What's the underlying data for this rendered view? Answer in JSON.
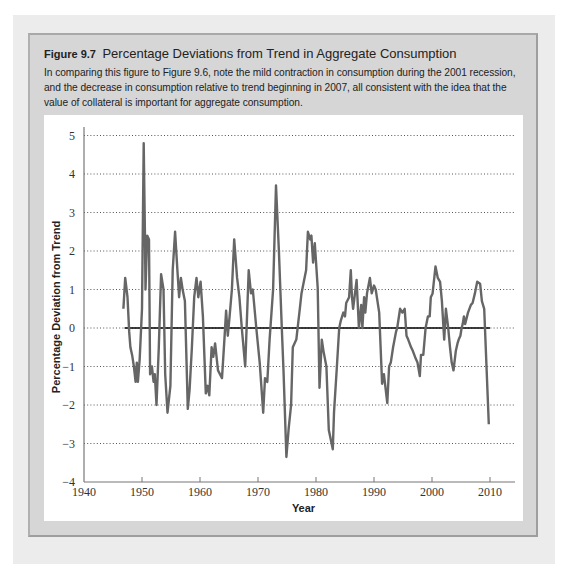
{
  "figure": {
    "number": "Figure 9.7",
    "title": "Percentage Deviations from Trend in Aggregate Consumption",
    "caption": "In comparing this figure to Figure 9.6, note the mild contraction in consumption during the 2001 recession, and the decrease in consumption relative to trend beginning in 2007, all consistent with the idea that the value of collateral is important for aggregate consumption."
  },
  "colors": {
    "series": "#666666",
    "zero_line": "#000000",
    "grid": "#555555",
    "figure_box": "#d6d6d6",
    "outer_bg": "#ececec"
  },
  "chart_data": {
    "type": "line",
    "title": "Percentage Deviations from Trend in Aggregate Consumption",
    "xlabel": "Year",
    "ylabel": "Percentage Deviation from Trend",
    "xlim": [
      1940,
      2012
    ],
    "ylim": [
      -4,
      5
    ],
    "xticks": [
      1940,
      1950,
      1960,
      1970,
      1980,
      1990,
      2000,
      2010
    ],
    "yticks": [
      5,
      4,
      3,
      2,
      1,
      0,
      -1,
      -2,
      -3,
      -4
    ],
    "grid": "horizontal dotted",
    "legend": "none",
    "reference_line": {
      "y": 0,
      "x_from": 1947,
      "x_to": 2010
    },
    "series": [
      {
        "name": "Consumption deviation from trend",
        "x": [
          1946.8,
          1947.1,
          1947.5,
          1947.8,
          1948.0,
          1948.3,
          1948.6,
          1948.9,
          1949.1,
          1949.3,
          1949.6,
          1950.0,
          1950.3,
          1950.5,
          1950.6,
          1950.9,
          1951.2,
          1951.4,
          1951.7,
          1952.0,
          1952.2,
          1952.5,
          1952.9,
          1953.3,
          1953.7,
          1954.0,
          1954.4,
          1954.9,
          1955.3,
          1955.7,
          1956.1,
          1956.4,
          1956.7,
          1957.0,
          1957.4,
          1957.9,
          1958.2,
          1958.6,
          1959.0,
          1959.4,
          1959.7,
          1960.1,
          1960.5,
          1961.0,
          1961.3,
          1961.6,
          1962.0,
          1962.3,
          1962.6,
          1963.1,
          1963.8,
          1964.2,
          1964.5,
          1964.8,
          1965.1,
          1965.5,
          1965.9,
          1966.4,
          1966.8,
          1967.2,
          1967.8,
          1968.4,
          1968.8,
          1969.1,
          1969.7,
          1970.3,
          1970.9,
          1971.2,
          1971.6,
          1972.0,
          1972.6,
          1973.1,
          1973.6,
          1974.1,
          1974.4,
          1974.9,
          1975.3,
          1975.7,
          1976.0,
          1976.6,
          1977.2,
          1977.5,
          1977.9,
          1978.3,
          1978.6,
          1979.0,
          1979.2,
          1979.5,
          1979.8,
          1980.3,
          1980.6,
          1981.0,
          1981.3,
          1981.8,
          1982.2,
          1982.9,
          1983.1,
          1983.6,
          1984.0,
          1984.3,
          1984.7,
          1985.0,
          1985.2,
          1985.7,
          1986.0,
          1986.2,
          1986.4,
          1987.0,
          1987.4,
          1987.8,
          1988.0,
          1988.3,
          1988.5,
          1988.8,
          1989.3,
          1989.6,
          1990.0,
          1990.3,
          1990.9,
          1991.4,
          1991.7,
          1992.3,
          1992.6,
          1992.9,
          1993.3,
          1993.8,
          1994.0,
          1994.5,
          1994.9,
          1995.3,
          1995.6,
          1995.9,
          1996.4,
          1996.7,
          1997.2,
          1997.5,
          1997.9,
          1998.1,
          1998.5,
          1998.9,
          1999.3,
          1999.6,
          1999.8,
          2000.1,
          2000.6,
          2001.0,
          2001.4,
          2001.7,
          2002.1,
          2002.4,
          2002.8,
          2003.1,
          2003.4,
          2003.7,
          2004.1,
          2004.4,
          2004.6,
          2004.9,
          2005.1,
          2005.3,
          2005.5,
          2005.7,
          2006.2,
          2006.7,
          2007.0,
          2007.4,
          2007.8,
          2008.3,
          2008.6,
          2009.0,
          2009.8
        ],
        "y": [
          0.5,
          1.3,
          0.8,
          -0.1,
          -0.5,
          -0.7,
          -1.0,
          -1.4,
          -0.9,
          -1.4,
          -0.8,
          0.5,
          4.8,
          2.5,
          1.0,
          2.4,
          2.3,
          -1.2,
          -1.0,
          -1.4,
          -1.2,
          -2.0,
          -0.5,
          1.4,
          1.0,
          -1.2,
          -2.2,
          -1.5,
          1.5,
          2.5,
          1.5,
          0.8,
          1.3,
          1.0,
          0.7,
          -2.1,
          -1.6,
          -0.5,
          0.8,
          1.3,
          0.8,
          1.2,
          0.3,
          -1.7,
          -1.5,
          -1.75,
          -0.5,
          -0.75,
          -0.4,
          -1.1,
          -1.3,
          -0.3,
          0.45,
          -0.2,
          0.3,
          1.0,
          2.3,
          1.3,
          0.8,
          0.0,
          -1.0,
          1.5,
          0.9,
          1.0,
          0.0,
          -0.9,
          -2.2,
          -1.3,
          -1.4,
          -0.3,
          1.0,
          3.7,
          2.0,
          0.0,
          -1.1,
          -3.35,
          -2.6,
          -2.0,
          -0.5,
          -0.3,
          0.5,
          0.9,
          1.2,
          1.5,
          2.5,
          2.3,
          2.4,
          1.7,
          2.2,
          1.05,
          -1.55,
          -0.3,
          -0.6,
          -1.0,
          -2.65,
          -3.15,
          -2.2,
          -1.0,
          0.0,
          0.2,
          0.4,
          0.3,
          0.65,
          0.8,
          1.5,
          0.8,
          0.5,
          1.25,
          0.0,
          0.6,
          0.0,
          0.8,
          0.4,
          0.9,
          1.3,
          0.9,
          1.1,
          1.0,
          0.4,
          -1.45,
          -1.2,
          -1.95,
          -1.0,
          -0.9,
          -0.5,
          -0.1,
          0.0,
          0.5,
          0.4,
          0.5,
          -0.2,
          -0.3,
          -0.5,
          -0.6,
          -0.8,
          -0.9,
          -1.25,
          -0.7,
          -0.7,
          0.0,
          0.3,
          0.3,
          0.8,
          0.9,
          1.6,
          1.3,
          1.2,
          0.7,
          -0.3,
          0.5,
          0.0,
          -0.5,
          -0.9,
          -1.1,
          -0.6,
          -0.4,
          -0.3,
          -0.2,
          0.0,
          0.1,
          0.3,
          0.1,
          0.4,
          0.6,
          0.65,
          0.9,
          1.2,
          1.15,
          0.7,
          0.5,
          -2.5
        ]
      }
    ]
  }
}
